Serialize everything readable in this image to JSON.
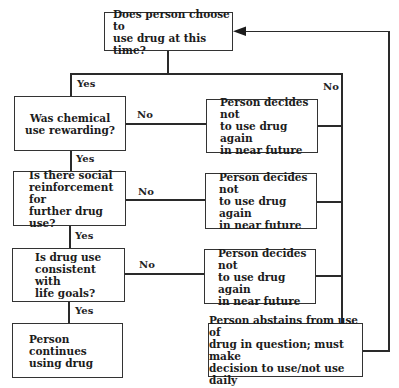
{
  "diagram": {
    "type": "flowchart",
    "start": {
      "text": "Does person choose to\nuse drug at this time?"
    },
    "questions": [
      {
        "text": "Was chemical\nuse rewarding?"
      },
      {
        "text": "Is there social\nreinforcement for\nfurther drug use?"
      },
      {
        "text": "Is drug use\nconsistent with\nlife goals?"
      }
    ],
    "no_outcomes": [
      {
        "text": "Person decides not\nto use drug again\nin near future"
      },
      {
        "text": "Person decides not\nto use drug again\nin near future"
      },
      {
        "text": "Person decides not\nto use drug again\nin near future"
      }
    ],
    "continue": {
      "text": "Person continues\nusing drug"
    },
    "abstain": {
      "text": "Person abstains from use of\ndrug in question; must make\ndecision to use/not use daily"
    },
    "labels": {
      "yes_top": "Yes",
      "no_top": "No",
      "no_1": "No",
      "yes_1": "Yes",
      "no_2": "No",
      "yes_2": "Yes",
      "no_3": "No",
      "yes_3": "Yes"
    },
    "colors": {
      "line": "#2a2a2a",
      "border": "#333333",
      "background": "#ffffff"
    }
  }
}
